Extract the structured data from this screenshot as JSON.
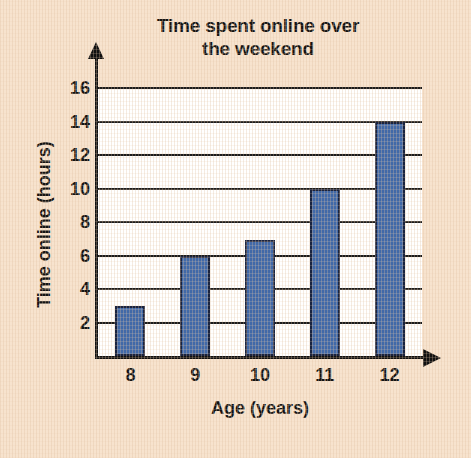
{
  "chart_data": {
    "type": "bar",
    "title": "Time spent online over the weekend",
    "title_line1": "Time spent online over",
    "title_line2": "the weekend",
    "xlabel": "Age (years)",
    "ylabel": "Time online (hours)",
    "categories": [
      "8",
      "9",
      "10",
      "11",
      "12"
    ],
    "values": [
      3,
      6,
      6.9,
      10,
      14
    ],
    "ylim": [
      0,
      16
    ],
    "yticks": [
      2,
      4,
      6,
      8,
      10,
      12,
      14,
      16
    ],
    "grid": true,
    "legend": null,
    "bar_color": "#4169a8",
    "bar_edge_color": "#19233f",
    "plot_background": "#ffffff",
    "page_background": "#f7e3ce",
    "axis_color": "#101010"
  }
}
